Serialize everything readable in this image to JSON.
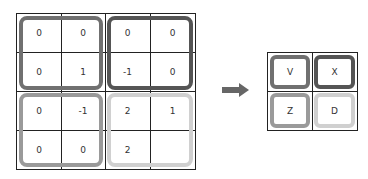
{
  "input_grid": {
    "rows": [
      [
        "0",
        "0",
        "0",
        "0"
      ],
      [
        "0",
        "1",
        "-1",
        "0"
      ],
      [
        "0",
        "-1",
        "2",
        "1"
      ],
      [
        "0",
        "0",
        "2",
        ""
      ]
    ]
  },
  "output_grid": {
    "rows": [
      [
        "V",
        "X"
      ],
      [
        "Z",
        "D"
      ]
    ]
  },
  "colors": {
    "top_left": "#707070",
    "top_right": "#555555",
    "bottom_left": "#9a9a9a",
    "bottom_right": "#d0d0d0",
    "arrow": "#666666",
    "grid_line": "#222222"
  }
}
